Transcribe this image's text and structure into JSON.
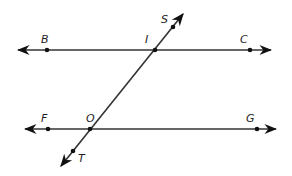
{
  "diagram": {
    "colors": {
      "line": "#333333",
      "point": "#111111",
      "label": "#222222"
    },
    "lines": [
      {
        "name": "line-BC",
        "x1": 18,
        "y1": 50,
        "x2": 271,
        "y2": 50
      },
      {
        "name": "line-FG",
        "x1": 25,
        "y1": 129,
        "x2": 276,
        "y2": 129
      },
      {
        "name": "transversal-ST",
        "x1": 183,
        "y1": 14,
        "x2": 61,
        "y2": 166
      }
    ],
    "points": [
      {
        "label": "B",
        "x": 47,
        "y": 50,
        "lx": 41,
        "ly": 43
      },
      {
        "label": "I",
        "x": 155,
        "y": 50,
        "lx": 145,
        "ly": 43
      },
      {
        "label": "C",
        "x": 250,
        "y": 50,
        "lx": 240,
        "ly": 43
      },
      {
        "label": "S",
        "x": 173,
        "y": 27,
        "lx": 161,
        "ly": 23
      },
      {
        "label": "F",
        "x": 48,
        "y": 129,
        "lx": 41,
        "ly": 122
      },
      {
        "label": "O",
        "x": 90,
        "y": 129,
        "lx": 86,
        "ly": 122
      },
      {
        "label": "G",
        "x": 257,
        "y": 129,
        "lx": 246,
        "ly": 122
      },
      {
        "label": "T",
        "x": 73,
        "y": 151,
        "lx": 78,
        "ly": 162
      }
    ]
  }
}
